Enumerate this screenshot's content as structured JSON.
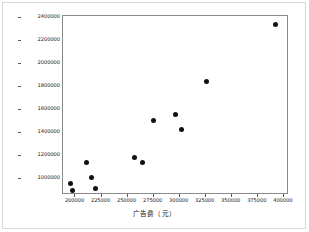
{
  "chart_data": {
    "type": "scatter",
    "title": "",
    "xlabel": "广告费（元）",
    "ylabel": "销售收入（元）",
    "xlim": [
      188000,
      405000
    ],
    "ylim": [
      860000,
      2420000
    ],
    "xticks": [
      200000,
      225000,
      250000,
      275000,
      300000,
      325000,
      350000,
      375000,
      400000
    ],
    "xtick_labels": [
      "200000",
      "225000",
      "250000",
      "275000",
      "300000",
      "325000",
      "350000",
      "375000",
      "400000"
    ],
    "yticks": [
      1000000,
      1200000,
      1400000,
      1600000,
      1800000,
      2000000,
      2200000,
      2400000
    ],
    "ytick_labels": [
      "1000000",
      "1200000",
      "1400000",
      "1600000",
      "1800000",
      "2000000",
      "2200000",
      "2400000"
    ],
    "grid": false,
    "legend": false,
    "marker": "circle",
    "marker_color": "#111111",
    "x": [
      195000,
      197000,
      211000,
      215000,
      219000,
      257000,
      264000,
      274500,
      296000,
      302000,
      326000,
      392000
    ],
    "y": [
      962000,
      903000,
      1140000,
      1012000,
      913000,
      1188000,
      1146000,
      1513000,
      1565000,
      1432000,
      1852000,
      2350000
    ],
    "points": [
      {
        "x": 195000,
        "y": 962000
      },
      {
        "x": 197000,
        "y": 903000
      },
      {
        "x": 211000,
        "y": 1140000
      },
      {
        "x": 215000,
        "y": 1012000
      },
      {
        "x": 219000,
        "y": 913000
      },
      {
        "x": 257000,
        "y": 1188000
      },
      {
        "x": 264000,
        "y": 1146000
      },
      {
        "x": 274500,
        "y": 1513000
      },
      {
        "x": 296000,
        "y": 1565000
      },
      {
        "x": 302000,
        "y": 1432000
      },
      {
        "x": 326000,
        "y": 1852000
      },
      {
        "x": 392000,
        "y": 2350000
      }
    ]
  }
}
